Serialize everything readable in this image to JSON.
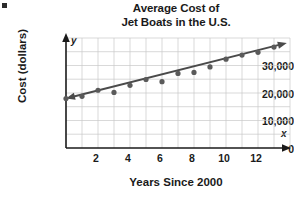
{
  "figure": {
    "title_line1": "Average Cost of",
    "title_line2": "Jet Boats in the U.S.",
    "corner_mark": "",
    "y_axis_letter": "y",
    "x_axis_letter": "x"
  },
  "chart_data": {
    "type": "scatter",
    "title": "Average Cost of Jet Boats in the U.S.",
    "subtitle": "",
    "xlabel": "Years Since 2000",
    "ylabel": "Cost (dollars)",
    "xlim": [
      0,
      14
    ],
    "ylim": [
      0,
      40000
    ],
    "grid": true,
    "legend": false,
    "x_ticks": [
      2,
      4,
      6,
      8,
      10,
      12
    ],
    "x_tick_labels": [
      "2",
      "4",
      "6",
      "8",
      "10",
      "12"
    ],
    "x_minor_step": 1,
    "y_ticks": [
      0,
      10000,
      20000,
      30000
    ],
    "y_tick_labels": [
      "0",
      "10,000",
      "20,000",
      "30,000"
    ],
    "y_minor_step": 5000,
    "x": [
      0,
      1,
      2,
      3,
      4,
      5,
      6,
      7,
      8,
      9,
      10,
      11,
      12,
      13
    ],
    "values": [
      18000,
      18800,
      21000,
      20200,
      22800,
      24900,
      24100,
      27100,
      27500,
      29500,
      32300,
      33800,
      34800,
      36700
    ],
    "point_color": "#5a5a5a",
    "point_radius": 2.6,
    "trend_line": {
      "label": "line of best fit",
      "x_start": 0,
      "y_start": 18000,
      "x_end": 13.8,
      "y_end": 38200,
      "color": "#4a4a4a",
      "arrow_start": true,
      "arrow_end": true
    }
  }
}
